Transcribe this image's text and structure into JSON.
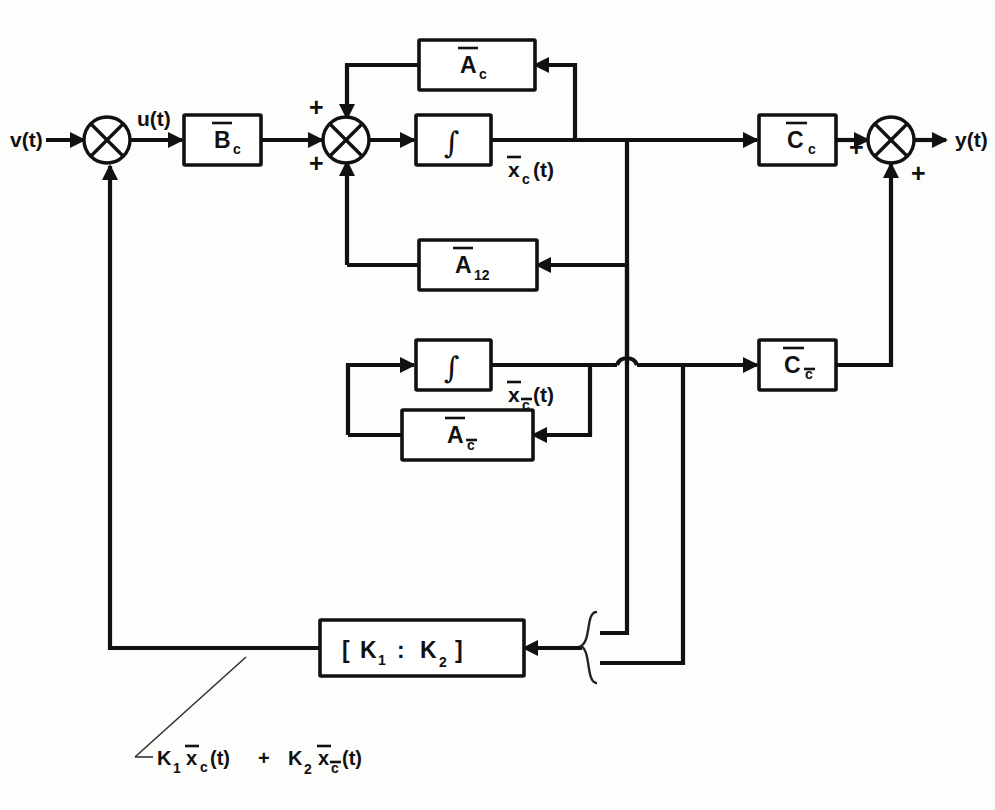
{
  "diagram": {
    "signals": {
      "input": "v(t)",
      "control": "u(t)",
      "output": "y(t)",
      "state_c": "x",
      "state_c_paren": "(t)",
      "state_c_sub": "c",
      "state_cbar_sub": "c"
    },
    "blocks": {
      "b_c": {
        "base": "B",
        "sub": "c"
      },
      "a_c": {
        "base": "A",
        "sub": "c"
      },
      "a_12": {
        "base": "A",
        "sub": "12"
      },
      "a_cbar": {
        "base": "A",
        "sub": "c"
      },
      "c_c": {
        "base": "C",
        "sub": "c"
      },
      "c_cbar": {
        "base": "C",
        "sub": "c"
      },
      "integrator_1": {
        "glyph": "∫"
      },
      "integrator_2": {
        "glyph": "∫"
      },
      "gain": {
        "open": "[",
        "k1": "K",
        "k1_sub": "1",
        "colon": ":",
        "k2": "K",
        "k2_sub": "2",
        "close": "]"
      }
    },
    "signs": {
      "summer_in_left": "+",
      "summer_in_bottom": "+",
      "summer_mid_top": "+",
      "summer_mid_left": "+",
      "summer_out_left": "+",
      "summer_out_bottom": "+"
    },
    "annotation": {
      "k1": "K",
      "k1_sub": "1",
      "x1": "x",
      "x1_sub": "c",
      "x1_t": "(t)",
      "plus": "+",
      "k2": "K",
      "k2_sub": "2",
      "x2": "x",
      "x2_sub": "c",
      "x2_t": "(t)",
      "full_text": "K1 xc(t) + K2 xc(t)"
    },
    "colors": {
      "ink": "#111111",
      "paper": "#fdfdfc"
    }
  }
}
